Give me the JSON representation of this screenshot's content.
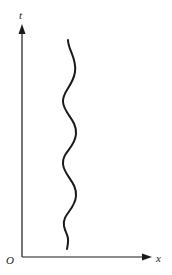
{
  "diagram": {
    "type": "spacetime worldline diagram",
    "axes": {
      "vertical": {
        "label": "t"
      },
      "horizontal": {
        "label": "x"
      },
      "origin": {
        "label": "O"
      }
    },
    "curve": {
      "description": "wavy worldline oscillating in x while moving upward in t",
      "oscillations": 4,
      "color": "#1a1a1a"
    },
    "colors": {
      "ink": "#1a1a1a",
      "background": "#ffffff"
    }
  }
}
